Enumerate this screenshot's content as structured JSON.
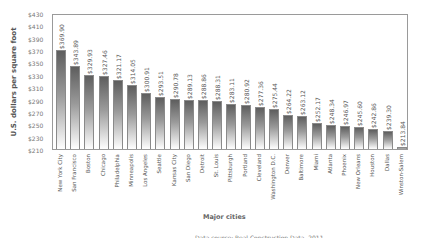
{
  "chart_data": {
    "type": "bar",
    "title": "",
    "xlabel": "Major cities",
    "ylabel": "U.S. dollars per square foot",
    "ylim": [
      210,
      430
    ],
    "yticks": [
      "$430",
      "$410",
      "$390",
      "$370",
      "$350",
      "$330",
      "$310",
      "$290",
      "$270",
      "$250",
      "$230",
      "$210"
    ],
    "categories": [
      "New York City",
      "San Francisco",
      "Boston",
      "Chicago",
      "Philadelphia",
      "Minneapolis",
      "Los Angeles",
      "Seattle",
      "Kansas City",
      "San Diego",
      "Detroit",
      "St. Louis",
      "Pittsburgh",
      "Portland",
      "Cleveland",
      "Washington D.C.",
      "Denver",
      "Baltimore",
      "Miami",
      "Atlanta",
      "Phoenix",
      "New Orleans",
      "Houston",
      "Dallas",
      "Winston-Salem"
    ],
    "values": [
      369.9,
      343.89,
      329.93,
      327.46,
      321.17,
      314.05,
      300.91,
      293.51,
      290.78,
      289.13,
      288.86,
      288.31,
      283.11,
      280.92,
      277.36,
      275.44,
      264.22,
      263.12,
      252.17,
      248.34,
      246.97,
      245.6,
      242.86,
      239.3,
      213.84
    ],
    "value_labels": [
      "$369.90",
      "$343.89",
      "$329.93",
      "$327.46",
      "$321.17",
      "$314.05",
      "$300.91",
      "$293.51",
      "$290.78",
      "$289.13",
      "$288.86",
      "$288.31",
      "$283.11",
      "$280.92",
      "$277.36",
      "$275.44",
      "$264.22",
      "$263.12",
      "$252.17",
      "$248.34",
      "$246.97",
      "$245.60",
      "$242.86",
      "$239.30",
      "$213.84"
    ],
    "grid": false,
    "legend": null,
    "bar_style": "vertical gradient dark gray to white"
  },
  "footer": {
    "source_text": "Data source: Real Construction Data, 2011 ..."
  }
}
